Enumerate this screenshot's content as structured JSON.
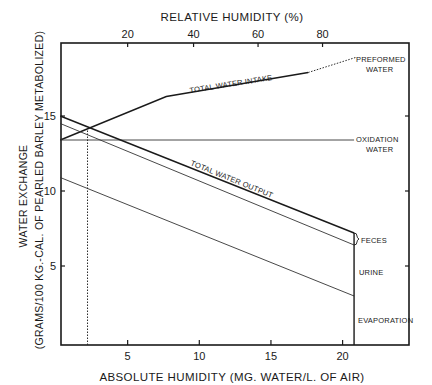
{
  "chart_data": {
    "type": "line",
    "title": "",
    "xlabel": "ABSOLUTE HUMIDITY (MG. WATER/L. OF AIR)",
    "x2label": "RELATIVE HUMIDITY (%)",
    "ylabel_line1": "WATER EXCHANGE",
    "ylabel_line2": "(GRAMS/100 KG.-CAL. OF PEARLED BARLEY METABOLIZED)",
    "xlim": [
      0,
      24.6
    ],
    "ylim": [
      0,
      20.1
    ],
    "x_ticks": [
      5,
      10,
      15,
      20
    ],
    "x_tick_labels": [
      "5",
      "10",
      "15",
      "20"
    ],
    "x2_ticks": [
      {
        "abs": 5.0,
        "label": "20"
      },
      {
        "abs": 9.6,
        "label": "40"
      },
      {
        "abs": 14.1,
        "label": "60"
      },
      {
        "abs": 18.6,
        "label": "80"
      }
    ],
    "y_ticks": [
      5,
      10,
      15
    ],
    "y_tick_labels": [
      "5",
      "10",
      "15"
    ],
    "grid": false,
    "series": [
      {
        "name": "TOTAL WATER INTAKE",
        "style": "solid",
        "points": [
          [
            0.3,
            13.4
          ],
          [
            7.7,
            16.3
          ],
          [
            17.6,
            17.9
          ]
        ]
      },
      {
        "name": "TOTAL WATER INTAKE (extrapolated)",
        "style": "dotted",
        "points": [
          [
            17.6,
            17.9
          ],
          [
            20.9,
            18.9
          ]
        ]
      },
      {
        "name": "OXIDATION WATER",
        "style": "solid-thin",
        "points": [
          [
            0.3,
            13.4
          ],
          [
            20.8,
            13.4
          ]
        ]
      },
      {
        "name": "TOTAL WATER OUTPUT",
        "style": "solid",
        "points": [
          [
            0.3,
            15.0
          ],
          [
            20.8,
            7.2
          ]
        ]
      },
      {
        "name": "FECES boundary",
        "style": "solid-thin",
        "points": [
          [
            0.3,
            14.5
          ],
          [
            20.8,
            6.4
          ]
        ]
      },
      {
        "name": "URINE boundary",
        "style": "solid-thin",
        "points": [
          [
            0.3,
            10.9
          ],
          [
            20.8,
            3.0
          ]
        ]
      }
    ],
    "reference_lines": [
      {
        "name": "equilibrium-dotted-vertical",
        "style": "dotted",
        "x": 2.2,
        "y_from": 0,
        "y_to": 14.1
      },
      {
        "name": "end-vertical",
        "style": "solid",
        "x": 20.8,
        "y_from": 0,
        "y_to": 7.2
      }
    ],
    "annotations": [
      {
        "text": "TOTAL WATER INTAKE",
        "kind": "line-label"
      },
      {
        "text": "TOTAL WATER OUTPUT",
        "kind": "line-label"
      },
      {
        "text_lines": [
          "PREFORMED",
          "WATER"
        ],
        "kind": "right-label"
      },
      {
        "text_lines": [
          "OXIDATION",
          "WATER"
        ],
        "kind": "right-label"
      },
      {
        "text": "FECES",
        "kind": "right-label"
      },
      {
        "text": "URINE",
        "kind": "right-label"
      },
      {
        "text": "EVAPORATION",
        "kind": "right-label"
      }
    ]
  }
}
